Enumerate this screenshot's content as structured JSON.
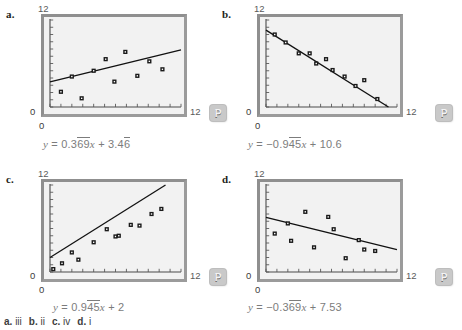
{
  "figure": {
    "background": "#ffffff",
    "plot_bg": "#f2f2f2",
    "frame_color": "#9b9b9b",
    "axis_label_color": "#5b5b5b",
    "equation_color": "#7c7c7c",
    "marker_color": "#1a1a1a",
    "line_color": "#111111",
    "badge_color": "#c9c9c9",
    "badge_label": "P"
  },
  "panels": [
    {
      "id": "a",
      "label": "a.",
      "ymax_label": "12",
      "xmax_label": "12",
      "origin_y_label": "0",
      "origin_x_label": "0",
      "equation": {
        "lhs": "y",
        "eq": "=",
        "slope": "0.3",
        "slope_rep": "69",
        "slope_var": "x",
        "plus": "+",
        "intercept": "3.4",
        "intercept_rep": "6",
        "full": "y = 0.369x + 3.46"
      }
    },
    {
      "id": "b",
      "label": "b.",
      "ymax_label": "12",
      "xmax_label": "12",
      "origin_y_label": "0",
      "origin_x_label": "0",
      "equation": {
        "lhs": "y",
        "eq": "=",
        "slope": "−0.9",
        "slope_rep": "45",
        "slope_var": "x",
        "plus": "+",
        "intercept": "10.6",
        "intercept_rep": "",
        "full": "y = −0.945x + 10.6"
      }
    },
    {
      "id": "c",
      "label": "c.",
      "ymax_label": "12",
      "xmax_label": "12",
      "origin_y_label": "0",
      "origin_x_label": "0",
      "equation": {
        "lhs": "y",
        "eq": "=",
        "slope": "0.9",
        "slope_rep": "45",
        "slope_var": "x",
        "plus": "+",
        "intercept": "2",
        "intercept_rep": "",
        "full": "y = 0.945x + 2"
      }
    },
    {
      "id": "d",
      "label": "d.",
      "ymax_label": "12",
      "xmax_label": "12",
      "origin_y_label": "0",
      "origin_x_label": "0",
      "equation": {
        "lhs": "y",
        "eq": "=",
        "slope": "−0.3",
        "slope_rep": "69",
        "slope_var": "x",
        "plus": "+",
        "intercept": "7.53",
        "intercept_rep": "",
        "full": "y = −0.369x + 7.53"
      }
    }
  ],
  "answer_key": {
    "items": [
      {
        "key": "a.",
        "value": "iii"
      },
      {
        "key": "b.",
        "value": "ii"
      },
      {
        "key": "c.",
        "value": "iv"
      },
      {
        "key": "d.",
        "value": "i"
      }
    ]
  },
  "chart_data": [
    {
      "id": "a",
      "type": "scatter",
      "title": "",
      "xlabel": "",
      "ylabel": "",
      "xlim": [
        0,
        12
      ],
      "ylim": [
        0,
        12
      ],
      "xticks": [
        0,
        1,
        2,
        3,
        4,
        5,
        6,
        7,
        8,
        9,
        10,
        11,
        12
      ],
      "yticks": [
        0,
        1,
        2,
        3,
        4,
        5,
        6,
        7,
        8,
        9,
        10,
        11,
        12
      ],
      "tick_labels_shown": [
        "0",
        "12"
      ],
      "grid": false,
      "points": [
        [
          1.0,
          2.1
        ],
        [
          2.0,
          4.2
        ],
        [
          2.9,
          1.2
        ],
        [
          4.0,
          5.0
        ],
        [
          5.1,
          6.6
        ],
        [
          5.9,
          3.5
        ],
        [
          6.9,
          7.6
        ],
        [
          8.0,
          4.3
        ],
        [
          9.1,
          6.3
        ],
        [
          10.3,
          5.2
        ]
      ],
      "fit_line": {
        "slope": 0.369,
        "intercept": 3.46,
        "label": "y = 0.369x + 3.46"
      }
    },
    {
      "id": "b",
      "type": "scatter",
      "title": "",
      "xlabel": "",
      "ylabel": "",
      "xlim": [
        0,
        12
      ],
      "ylim": [
        0,
        12
      ],
      "xticks": [
        0,
        1,
        2,
        3,
        4,
        5,
        6,
        7,
        8,
        9,
        10,
        11,
        12
      ],
      "yticks": [
        0,
        1,
        2,
        3,
        4,
        5,
        6,
        7,
        8,
        9,
        10,
        11,
        12
      ],
      "tick_labels_shown": [
        "0",
        "12"
      ],
      "grid": false,
      "points": [
        [
          0.8,
          10.0
        ],
        [
          1.8,
          8.9
        ],
        [
          3.0,
          7.4
        ],
        [
          4.0,
          7.4
        ],
        [
          4.6,
          6.0
        ],
        [
          5.5,
          6.6
        ],
        [
          6.1,
          5.1
        ],
        [
          7.2,
          4.2
        ],
        [
          8.2,
          2.9
        ],
        [
          9.0,
          3.7
        ],
        [
          10.2,
          1.1
        ]
      ],
      "fit_line": {
        "slope": -0.945,
        "intercept": 10.6,
        "label": "y = −0.945x + 10.6"
      }
    },
    {
      "id": "c",
      "type": "scatter",
      "title": "",
      "xlabel": "",
      "ylabel": "",
      "xlim": [
        0,
        12
      ],
      "ylim": [
        0,
        12
      ],
      "xticks": [
        0,
        1,
        2,
        3,
        4,
        5,
        6,
        7,
        8,
        9,
        10,
        11,
        12
      ],
      "yticks": [
        0,
        1,
        2,
        3,
        4,
        5,
        6,
        7,
        8,
        9,
        10,
        11,
        12
      ],
      "tick_labels_shown": [
        "0",
        "12"
      ],
      "grid": false,
      "points": [
        [
          0.3,
          0.4
        ],
        [
          1.1,
          1.2
        ],
        [
          2.0,
          2.7
        ],
        [
          2.6,
          1.7
        ],
        [
          4.0,
          4.1
        ],
        [
          5.2,
          5.9
        ],
        [
          6.0,
          4.9
        ],
        [
          6.3,
          5.0
        ],
        [
          7.4,
          6.5
        ],
        [
          8.2,
          6.4
        ],
        [
          9.3,
          8.0
        ],
        [
          10.2,
          8.7
        ]
      ],
      "fit_line": {
        "slope": 0.945,
        "intercept": 2,
        "label": "y = 0.945x + 2"
      }
    },
    {
      "id": "d",
      "type": "scatter",
      "title": "",
      "xlabel": "",
      "ylabel": "",
      "xlim": [
        0,
        12
      ],
      "ylim": [
        0,
        12
      ],
      "xticks": [
        0,
        1,
        2,
        3,
        4,
        5,
        6,
        7,
        8,
        9,
        10,
        11,
        12
      ],
      "yticks": [
        0,
        1,
        2,
        3,
        4,
        5,
        6,
        7,
        8,
        9,
        10,
        11,
        12
      ],
      "tick_labels_shown": [
        "0",
        "12"
      ],
      "grid": false,
      "points": [
        [
          0.8,
          5.3
        ],
        [
          2.0,
          6.7
        ],
        [
          2.3,
          4.3
        ],
        [
          3.6,
          8.3
        ],
        [
          4.4,
          3.4
        ],
        [
          5.7,
          7.6
        ],
        [
          6.2,
          5.9
        ],
        [
          7.3,
          1.9
        ],
        [
          8.5,
          4.4
        ],
        [
          9.0,
          3.1
        ],
        [
          10.0,
          2.9
        ]
      ],
      "fit_line": {
        "slope": -0.369,
        "intercept": 7.53,
        "label": "y = −0.369x + 7.53"
      }
    }
  ]
}
